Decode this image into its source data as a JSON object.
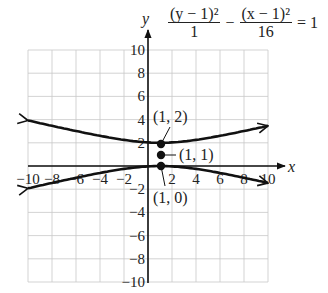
{
  "chart_data": {
    "type": "line",
    "title": "",
    "equation": {
      "term1_num": "(y − 1)²",
      "term1_den": "1",
      "minus": "−",
      "term2_num": "(x − 1)²",
      "term2_den": "16",
      "equals": "= 1"
    },
    "xlabel": "x",
    "ylabel": "y",
    "xlim": [
      -10,
      10
    ],
    "ylim": [
      -10,
      10
    ],
    "grid": true,
    "x_ticks": [
      "−10",
      "−8",
      "−6",
      "−4",
      "−2",
      "2",
      "4",
      "6",
      "8",
      "10"
    ],
    "y_ticks": [
      "10",
      "8",
      "6",
      "4",
      "2",
      "−2",
      "−4",
      "−6",
      "−8",
      "−10"
    ],
    "series": [
      {
        "name": "upper branch",
        "x": [
          -10,
          -8,
          -6,
          -4,
          -2,
          0,
          1,
          2,
          4,
          6,
          8,
          10
        ],
        "y": [
          3.93,
          3.46,
          3.02,
          2.6,
          2.25,
          2.03,
          2.0,
          2.03,
          2.25,
          2.6,
          3.02,
          3.46
        ]
      },
      {
        "name": "lower branch",
        "x": [
          -10,
          -8,
          -6,
          -4,
          -2,
          0,
          1,
          2,
          4,
          6,
          8,
          10
        ],
        "y": [
          -1.93,
          -1.46,
          -1.02,
          -0.6,
          -0.25,
          -0.03,
          0.0,
          -0.03,
          -0.25,
          -0.6,
          -1.02,
          -1.46
        ]
      }
    ],
    "points": [
      {
        "label": "(1, 2)",
        "x": 1,
        "y": 2
      },
      {
        "label": "(1, 1)",
        "x": 1,
        "y": 1
      },
      {
        "label": "(1, 0)",
        "x": 1,
        "y": 0
      }
    ]
  }
}
